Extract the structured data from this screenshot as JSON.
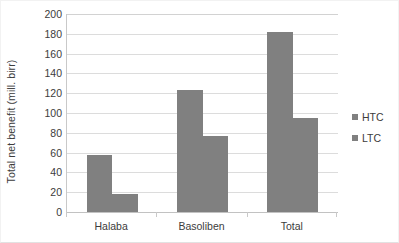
{
  "chart_data": {
    "type": "bar",
    "title": "",
    "subtitle": "",
    "xlabel": "",
    "ylabel": "Total net benefit (mill. birr)",
    "categories": [
      "Halaba",
      "Basoliben",
      "Total"
    ],
    "series": [
      {
        "name": "HTC",
        "color": "#808080",
        "values": [
          57.5,
          123.5,
          182
        ]
      },
      {
        "name": "LTC",
        "color": "#808080",
        "values": [
          18,
          77,
          95
        ]
      }
    ],
    "ylim": [
      0,
      200
    ],
    "ytick_step": 20,
    "yticks": [
      200,
      180,
      160,
      140,
      120,
      100,
      80,
      60,
      40,
      20,
      0
    ],
    "ytick_labels": [
      "200",
      "180",
      "160",
      "140",
      "120",
      "100",
      "80",
      "60",
      "40",
      "20",
      "0"
    ],
    "grid": {
      "horizontal": true,
      "vertical": false,
      "color": "#dcdcdc"
    },
    "legend": {
      "position": "right",
      "entries": [
        "HTC",
        "LTC"
      ],
      "marker": "square"
    },
    "bar_gap_within_group": 0,
    "annotations": []
  }
}
